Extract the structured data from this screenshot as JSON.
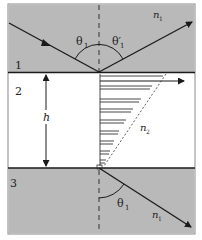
{
  "diagram": {
    "type": "frustrated total internal reflection",
    "colors": {
      "medium_fill": "#b9b9b9",
      "gap_fill": "#ffffff",
      "line": "#1a1a1a",
      "frame": "#8a8a8a"
    },
    "labels": {
      "region_1": "1",
      "region_2": "2",
      "region_3": "3",
      "gap_height": "h",
      "incident_angle": "θ",
      "incident_angle_sub": "1",
      "reflected_angle": "θ′",
      "reflected_angle_sub": "1",
      "transmitted_angle": "θ",
      "transmitted_angle_sub": "1",
      "index_top": "n",
      "index_top_sub": "1",
      "index_gap": "n",
      "index_gap_sub": "2",
      "index_bottom": "n",
      "index_bottom_sub": "1"
    }
  }
}
